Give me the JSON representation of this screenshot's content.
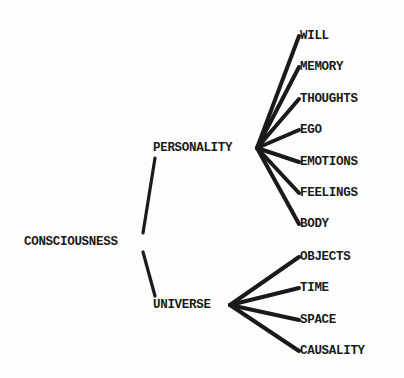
{
  "diagram": {
    "type": "tree",
    "root": {
      "label": "CONSCIOUSNESS",
      "x": 24,
      "y": 242
    },
    "branches": [
      {
        "label": "PERSONALITY",
        "x": 153,
        "y": 148,
        "hub": [
          257,
          148
        ],
        "children": [
          {
            "label": "WILL",
            "x": 300,
            "y": 36
          },
          {
            "label": "MEMORY",
            "x": 300,
            "y": 67
          },
          {
            "label": "THOUGHTS",
            "x": 300,
            "y": 99
          },
          {
            "label": "EGO",
            "x": 300,
            "y": 130
          },
          {
            "label": "EMOTIONS",
            "x": 300,
            "y": 162
          },
          {
            "label": "FEELINGS",
            "x": 300,
            "y": 193
          },
          {
            "label": "BODY",
            "x": 300,
            "y": 224
          }
        ]
      },
      {
        "label": "UNIVERSE",
        "x": 153,
        "y": 305,
        "hub": [
          230,
          305
        ],
        "children": [
          {
            "label": "OBJECTS",
            "x": 300,
            "y": 257
          },
          {
            "label": "TIME",
            "x": 300,
            "y": 288
          },
          {
            "label": "SPACE",
            "x": 300,
            "y": 320
          },
          {
            "label": "CAUSALITY",
            "x": 300,
            "y": 351
          }
        ]
      }
    ],
    "colors": {
      "ink": "#1a1a1a",
      "background": "#fdfdfd"
    }
  }
}
